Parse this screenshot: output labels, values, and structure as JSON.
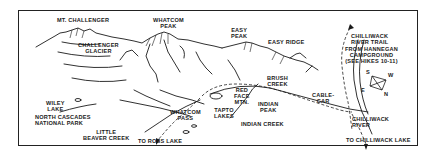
{
  "map": {
    "labels": {
      "mt_challenger": "MT. CHALLENGER",
      "whatcom_peak": "WHATCOM\nPEAK",
      "easy_peak": "EASY\nPEAK",
      "easy_ridge": "EASY RIDGE",
      "challenger_glacier": "CHALLENGER\nGLACIER",
      "chilliwack_river_trail": "CHILLIWACK\nRIVER TRAIL",
      "from_hannegan": "FROM HANNEGAN\nCAMPGROUND\n(SEE HIKES 10-11)",
      "brush_creek": "BRUSH\nCREEK",
      "red_face_mtn": "RED\nFACE\nMTN.",
      "indian_peak": "INDIAN\nPEAK",
      "cable_car": "CABLE-\nCAR",
      "tapto_lakes": "TAPTO\nLAKES",
      "whatcom_pass": "WHATCOM\nPASS",
      "wiley_lake": "WILEY\nLAKE",
      "north_cascades": "NORTH CASCADES\nNATIONAL PARK",
      "little_beaver_creek": "LITTLE\nBEAVER CREEK",
      "to_ross_lake": "TO ROSS LAKE",
      "indian_creek": "INDIAN CREEK",
      "chilliwack_river": "CHILLIWACK\nRIVER",
      "to_chilliwack_lake": "TO CHILLIWACK LAKE"
    },
    "compass": {
      "s": "S",
      "w": "W",
      "e": "E",
      "n": "N"
    },
    "colors": {
      "ink": "#1a1a1a",
      "paper": "#ffffff"
    }
  }
}
